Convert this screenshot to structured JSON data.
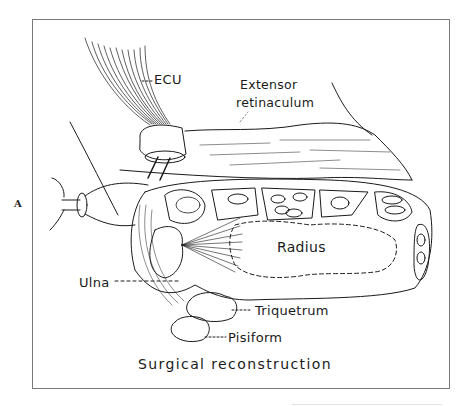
{
  "figure": {
    "panel_letter": "A",
    "caption": "Surgical reconstruction",
    "labels": {
      "ecu": "ECU",
      "extensor_line1": "Extensor",
      "extensor_line2": "retinaculum",
      "radius": "Radius",
      "ulna": "Ulna",
      "triquetrum": "Triquetrum",
      "pisiform": "Pisiform"
    },
    "colors": {
      "ink": "#1a1a1a",
      "frame": "#7a7a7a",
      "background": "#ffffff"
    }
  }
}
